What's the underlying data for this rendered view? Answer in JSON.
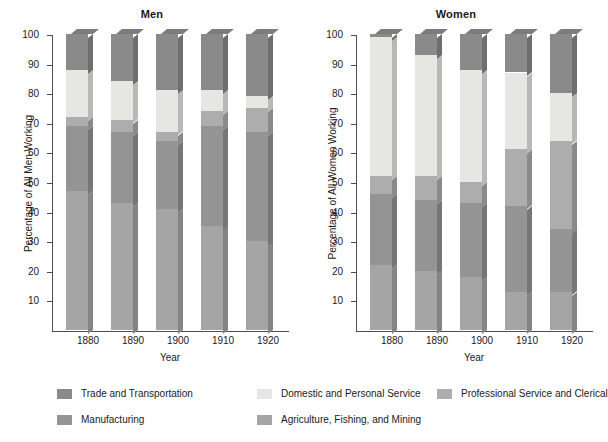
{
  "figure": {
    "panels": [
      {
        "key": "men",
        "title": "Men",
        "ylabel": "Percentage of All Men Working",
        "xlabel": "Year"
      },
      {
        "key": "women",
        "title": "Women",
        "ylabel": "Percentage of All Women Working",
        "xlabel": "Year"
      }
    ],
    "legend": [
      {
        "label": "Trade and Transportation",
        "color": "#8a8a8a"
      },
      {
        "label": "Domestic and Personal Service",
        "color": "#e6e6e2"
      },
      {
        "label": "Professional Service and Clerical",
        "color": "#adadad"
      },
      {
        "label": "Manufacturing",
        "color": "#949494"
      },
      {
        "label": "Agriculture, Fishing, and Mining",
        "color": "#a5a5a5"
      }
    ],
    "caption": ""
  },
  "chart_data": [
    {
      "type": "bar",
      "subtype": "stacked-percentage",
      "title": "Men",
      "xlabel": "Year",
      "ylabel": "Percentage of All Men Working",
      "categories": [
        "1880",
        "1890",
        "1900",
        "1910",
        "1920"
      ],
      "ylim": [
        0,
        100
      ],
      "yticks": [
        10,
        20,
        30,
        40,
        50,
        60,
        70,
        80,
        90,
        100
      ],
      "grid": false,
      "legend_position": "below-figure",
      "stack_order_bottom_to_top": [
        "Agriculture, Fishing, and Mining",
        "Manufacturing",
        "Professional Service and Clerical",
        "Domestic and Personal Service",
        "Trade and Transportation"
      ],
      "series": [
        {
          "name": "Agriculture, Fishing, and Mining",
          "color": "#a5a5a5",
          "values": [
            47,
            43,
            41,
            35,
            30
          ]
        },
        {
          "name": "Manufacturing",
          "color": "#949494",
          "values": [
            22,
            24,
            23,
            34,
            37
          ]
        },
        {
          "name": "Professional Service and Clerical",
          "color": "#adadad",
          "values": [
            3,
            4,
            3,
            5,
            8
          ]
        },
        {
          "name": "Domestic and Personal Service",
          "color": "#e6e6e2",
          "values": [
            16,
            13,
            14,
            7,
            4
          ]
        },
        {
          "name": "Trade and Transportation",
          "color": "#8a8a8a",
          "values": [
            12,
            16,
            19,
            19,
            21
          ]
        }
      ]
    },
    {
      "type": "bar",
      "subtype": "stacked-percentage",
      "title": "Women",
      "xlabel": "Year",
      "ylabel": "Percentage of All Women Working",
      "categories": [
        "1880",
        "1890",
        "1900",
        "1910",
        "1920"
      ],
      "ylim": [
        0,
        100
      ],
      "yticks": [
        10,
        20,
        30,
        40,
        50,
        60,
        70,
        80,
        90,
        100
      ],
      "grid": false,
      "legend_position": "below-figure",
      "stack_order_bottom_to_top": [
        "Agriculture, Fishing, and Mining",
        "Manufacturing",
        "Professional Service and Clerical",
        "Domestic and Personal Service",
        "Trade and Transportation"
      ],
      "series": [
        {
          "name": "Agriculture, Fishing, and Mining",
          "color": "#a5a5a5",
          "values": [
            22,
            20,
            18,
            13,
            13
          ]
        },
        {
          "name": "Manufacturing",
          "color": "#949494",
          "values": [
            24,
            24,
            25,
            29,
            21
          ]
        },
        {
          "name": "Professional Service and Clerical",
          "color": "#adadad",
          "values": [
            6,
            8,
            7,
            19,
            30
          ]
        },
        {
          "name": "Domestic and Personal Service",
          "color": "#e6e6e2",
          "values": [
            47,
            41,
            38,
            26,
            16
          ]
        },
        {
          "name": "Trade and Transportation",
          "color": "#8a8a8a",
          "values": [
            1,
            7,
            12,
            13,
            20
          ]
        }
      ]
    }
  ]
}
